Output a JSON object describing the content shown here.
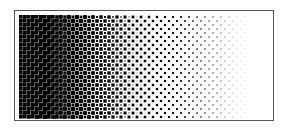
{
  "image": {
    "description": "Halftone gradient from black (left) to white (right) inside a thin rectangular frame",
    "gradient": {
      "start_color": "#000000",
      "end_color": "#ffffff",
      "direction": "left-to-right"
    },
    "frame_color": "#555555",
    "dot_spacing_px": 4
  }
}
